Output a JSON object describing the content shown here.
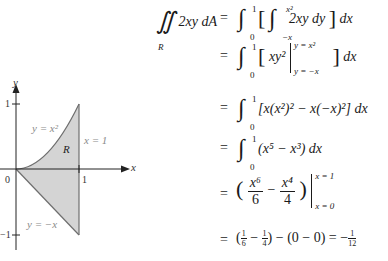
{
  "figure": {
    "axes": {
      "x_label": "x",
      "y_label": "y",
      "origin_label": "0",
      "x_tick": "1",
      "y_tick_pos": "1",
      "y_tick_neg": "−1"
    },
    "curves": {
      "upper": "y = x²",
      "lower": "y = −x",
      "right": "x = 1"
    },
    "region_label": "R",
    "colors": {
      "fill": "#d4d4d4",
      "curve": "#6e6e6e",
      "axis": "#222222",
      "label": "#8a8a8a"
    }
  },
  "derivation": {
    "lhs": {
      "integrand": "2xy dA",
      "region": "R"
    },
    "steps": [
      {
        "text": "∫₀¹ [ ∫₋ₓ^{x²} 2xy dy ] dx"
      },
      {
        "text": "∫₀¹ [ xy² |_{y=−x}^{y=x²} ] dx"
      },
      {
        "text": "∫₀¹ [x(x²)² − x(−x)²] dx"
      },
      {
        "text": "∫₀¹ (x⁵ − x³) dx"
      },
      {
        "text": "(x⁶/6 − x⁴/4) |_{x=0}^{x=1}"
      },
      {
        "text": "(1/6 − 1/4) − (0 − 0) = −1/12"
      }
    ],
    "tokens": {
      "eq": "=",
      "int": "∫",
      "dblint": "∬",
      "lo0": "0",
      "hi1": "1",
      "lo_negx": "−x",
      "hi_x2": "x²",
      "s1_body": "2xy dy",
      "dx": "dx",
      "s2_body": "xy²",
      "s2_top": "y = x²",
      "s2_bot": "y = −x",
      "s3_body": "[x(x²)² − x(−x)²]",
      "s4_body": "(x⁵ − x³)",
      "x6": "x⁶",
      "six": "6",
      "x4": "x⁴",
      "four": "4",
      "minus": "−",
      "s5_top": "x = 1",
      "s5_bot": "x = 0",
      "one": "1",
      "twelve": "12",
      "s6_mid": "− (0 − 0) = −"
    }
  }
}
